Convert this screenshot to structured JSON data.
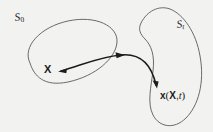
{
  "figure": {
    "background_color": "#f2f2f0",
    "stroke_color": "#4a4a4a",
    "arrow_color": "#1c1c1c",
    "text_color": "#1c1c1c",
    "width": 213,
    "height": 132
  },
  "labels": {
    "reference_region": {
      "base": "S",
      "subscript": "0",
      "full": "S0"
    },
    "current_region": {
      "base": "S",
      "subscript": "t",
      "full": "St"
    },
    "material_point": "X",
    "spatial_point": {
      "function": "x",
      "open_paren": "(",
      "arg1": "X",
      "comma": ",",
      "arg2": "t",
      "close_paren": ")",
      "full": "x (X, t)"
    }
  },
  "shapes": {
    "reference_blob": {
      "name": "ellipse-S0",
      "path": "M 30 63 C 22 47 40 27 68 21 C 96 15 118 26 117 42 C 116 58 96 76 68 82 C 44 87 34 76 30 63 Z"
    },
    "current_blob": {
      "name": "blob-St",
      "path": "M 140 22 C 146 10 160 5 172 10 C 186 16 198 34 201 58 C 204 82 197 104 185 117 C 173 129 158 126 152 114 C 146 102 150 86 152 70 C 154 54 150 44 144 38 C 139 33 137 28 140 22 Z"
    },
    "motion_arrow": {
      "name": "motion-arrow",
      "path": "M 60 71 C 78 66 96 58 120 56 C 142 54 152 66 156 84",
      "head_start": "leftward",
      "head_mid": "rightward",
      "head_end": "down-right"
    }
  },
  "icons": {
    "arrow_head": "arrow-head-icon"
  }
}
